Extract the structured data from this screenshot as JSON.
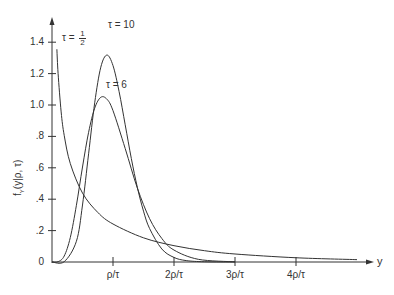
{
  "chart_data": {
    "type": "line",
    "title": "",
    "xlabel": "y",
    "ylabel": "f_Y(y|ρ, τ)",
    "ylabel_main": "f",
    "ylabel_sub": "Y",
    "ylabel_rest": "(y|ρ, τ)",
    "x_unit": "ρ/τ",
    "xlim": [
      0,
      5.2
    ],
    "ylim": [
      0,
      1.45
    ],
    "grid": false,
    "legend": "inline curve labels",
    "x_ticks": [
      {
        "value": 1,
        "label": "ρ/τ"
      },
      {
        "value": 2,
        "label": "2ρ/τ"
      },
      {
        "value": 3,
        "label": "3ρ/τ"
      },
      {
        "value": 4,
        "label": "4ρ/τ"
      }
    ],
    "y_ticks": [
      {
        "value": 0,
        "label": "0"
      },
      {
        "value": 0.2,
        "label": ".2"
      },
      {
        "value": 0.4,
        "label": ".4"
      },
      {
        "value": 0.6,
        "label": ".6"
      },
      {
        "value": 0.8,
        "label": ".8"
      },
      {
        "value": 1.0,
        "label": "1.0"
      },
      {
        "value": 1.2,
        "label": "1.2"
      },
      {
        "value": 1.4,
        "label": "1.4"
      }
    ],
    "series": [
      {
        "name": "τ = 10",
        "label_prefix": "τ = ",
        "label_value": "10",
        "x": [
          0,
          0.2,
          0.4,
          0.5,
          0.6,
          0.7,
          0.8,
          0.9,
          1.0,
          1.1,
          1.2,
          1.3,
          1.4,
          1.5,
          1.6,
          1.8,
          2.0,
          2.2,
          2.5,
          3.0
        ],
        "values": [
          0,
          0.002,
          0.132,
          0.363,
          0.689,
          1.014,
          1.241,
          1.318,
          1.251,
          1.085,
          0.874,
          0.66,
          0.474,
          0.324,
          0.213,
          0.083,
          0.029,
          0.009,
          0.0015,
          0
        ]
      },
      {
        "name": "τ = 6",
        "label_prefix": "τ = ",
        "label_value": "6",
        "x": [
          0,
          0.1,
          0.2,
          0.3,
          0.4,
          0.5,
          0.6,
          0.7,
          0.8,
          0.9,
          1.0,
          1.2,
          1.4,
          1.6,
          1.8,
          2.0,
          2.4,
          3.0
        ],
        "values": [
          0,
          0.002,
          0.038,
          0.156,
          0.361,
          0.605,
          0.826,
          0.98,
          1.049,
          1.037,
          0.964,
          0.723,
          0.47,
          0.276,
          0.15,
          0.076,
          0.017,
          0.001
        ]
      },
      {
        "name": "τ = 1/2",
        "label_prefix": "τ = ",
        "label_num": "1",
        "label_den": "2",
        "x": [
          0.08,
          0.1,
          0.15,
          0.2,
          0.3,
          0.5,
          0.75,
          1.0,
          1.5,
          2.0,
          2.5,
          3.0,
          4.0,
          5.0
        ],
        "values": [
          1.355,
          1.2,
          0.956,
          0.807,
          0.627,
          0.439,
          0.316,
          0.242,
          0.154,
          0.104,
          0.072,
          0.051,
          0.027,
          0.015
        ]
      }
    ]
  }
}
